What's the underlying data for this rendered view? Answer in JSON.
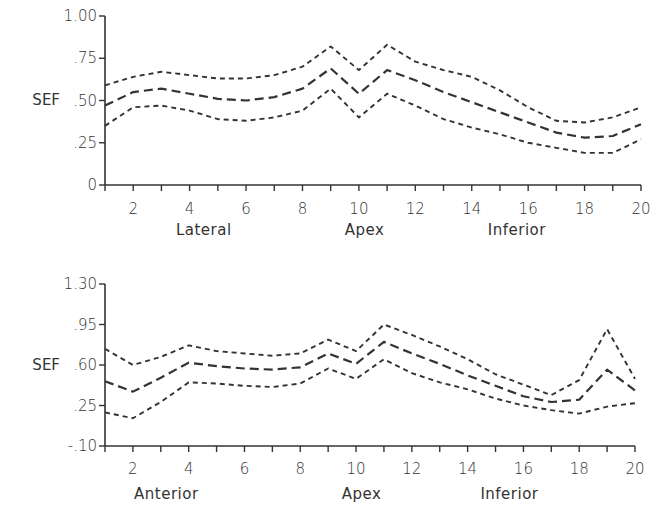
{
  "chart_data": [
    {
      "type": "line",
      "title": "",
      "ylabel": "SEF",
      "xlabel": "",
      "ylim": [
        0,
        1.0
      ],
      "yticks": [
        "0",
        ".25",
        ".50",
        ".75",
        "1.00"
      ],
      "ytick_values": [
        0,
        0.25,
        0.5,
        0.75,
        1.0
      ],
      "xlim": [
        1,
        20
      ],
      "xtick_labels": [
        "2",
        "4",
        "6",
        "8",
        "10",
        "12",
        "14",
        "16",
        "18",
        "20"
      ],
      "region_labels": [
        {
          "text": "Lateral",
          "x": 4.5
        },
        {
          "text": "Apex",
          "x": 10.2
        },
        {
          "text": "Inferior",
          "x": 15.6
        }
      ],
      "grid": false,
      "x": [
        1,
        2,
        3,
        4,
        5,
        6,
        7,
        8,
        9,
        10,
        11,
        12,
        13,
        14,
        15,
        16,
        17,
        18,
        19,
        20
      ],
      "series": [
        {
          "name": "upper",
          "style": "short-dash",
          "values": [
            0.59,
            0.64,
            0.67,
            0.65,
            0.63,
            0.63,
            0.65,
            0.7,
            0.82,
            0.68,
            0.83,
            0.73,
            0.68,
            0.64,
            0.56,
            0.46,
            0.38,
            0.37,
            0.4,
            0.46
          ]
        },
        {
          "name": "mean",
          "style": "long-dash",
          "values": [
            0.47,
            0.55,
            0.57,
            0.54,
            0.51,
            0.5,
            0.52,
            0.57,
            0.69,
            0.54,
            0.68,
            0.62,
            0.55,
            0.49,
            0.43,
            0.37,
            0.31,
            0.28,
            0.29,
            0.36
          ]
        },
        {
          "name": "lower",
          "style": "short-dash",
          "values": [
            0.35,
            0.46,
            0.47,
            0.44,
            0.39,
            0.38,
            0.4,
            0.44,
            0.57,
            0.4,
            0.54,
            0.47,
            0.39,
            0.34,
            0.3,
            0.25,
            0.22,
            0.19,
            0.19,
            0.27
          ]
        }
      ]
    },
    {
      "type": "line",
      "title": "",
      "ylabel": "SEF",
      "xlabel": "",
      "ylim": [
        -0.1,
        1.3
      ],
      "yticks": [
        "-.10",
        ".25",
        ".60",
        ".95",
        "1.30"
      ],
      "ytick_values": [
        -0.1,
        0.25,
        0.6,
        0.95,
        1.3
      ],
      "xlim": [
        1,
        20
      ],
      "xtick_labels": [
        "2",
        "4",
        "6",
        "8",
        "10",
        "12",
        "14",
        "16",
        "18",
        "20"
      ],
      "region_labels": [
        {
          "text": "Anterior",
          "x": 3.2
        },
        {
          "text": "Apex",
          "x": 10.2
        },
        {
          "text": "Inferior",
          "x": 15.5
        }
      ],
      "grid": false,
      "x": [
        1,
        2,
        3,
        4,
        5,
        6,
        7,
        8,
        9,
        10,
        11,
        12,
        13,
        14,
        15,
        16,
        17,
        18,
        19,
        20
      ],
      "series": [
        {
          "name": "upper",
          "style": "short-dash",
          "values": [
            0.74,
            0.6,
            0.67,
            0.77,
            0.72,
            0.7,
            0.68,
            0.7,
            0.82,
            0.72,
            0.95,
            0.86,
            0.76,
            0.65,
            0.52,
            0.43,
            0.34,
            0.47,
            0.91,
            0.48
          ]
        },
        {
          "name": "mean",
          "style": "long-dash",
          "values": [
            0.46,
            0.37,
            0.49,
            0.62,
            0.59,
            0.57,
            0.56,
            0.58,
            0.7,
            0.61,
            0.8,
            0.7,
            0.61,
            0.51,
            0.42,
            0.33,
            0.28,
            0.3,
            0.56,
            0.38
          ]
        },
        {
          "name": "lower",
          "style": "short-dash",
          "values": [
            0.19,
            0.14,
            0.28,
            0.45,
            0.44,
            0.42,
            0.41,
            0.44,
            0.57,
            0.48,
            0.65,
            0.53,
            0.45,
            0.39,
            0.31,
            0.25,
            0.21,
            0.18,
            0.24,
            0.27
          ]
        }
      ]
    }
  ]
}
